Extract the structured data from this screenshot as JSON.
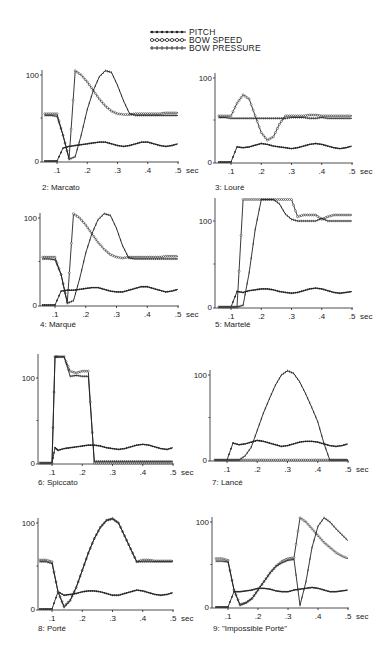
{
  "legend": {
    "items": [
      {
        "label": "PITCH",
        "marker": "filled-dot"
      },
      {
        "label": "BOW SPEED",
        "marker": "open-dot"
      },
      {
        "label": "BOW PRESSURE",
        "marker": "cross"
      }
    ]
  },
  "x_ticks": [
    ".1",
    ".2",
    ".3",
    ".4",
    ".5"
  ],
  "x_unit": "sec",
  "y_ticks": [
    "0",
    "100"
  ],
  "chart_data": [
    {
      "type": "line",
      "title": "2: Marcato",
      "xlabel": "sec",
      "ylabel": "",
      "xlim": [
        0.05,
        0.5
      ],
      "ylim": [
        0,
        100
      ],
      "x": [
        0.06,
        0.08,
        0.1,
        0.12,
        0.14,
        0.16,
        0.18,
        0.2,
        0.22,
        0.24,
        0.26,
        0.28,
        0.3,
        0.32,
        0.34,
        0.36,
        0.38,
        0.4,
        0.42,
        0.44,
        0.46,
        0.48,
        0.5
      ],
      "series": [
        {
          "name": "PITCH",
          "values": [
            0,
            0,
            0,
            15,
            17,
            18,
            19,
            20,
            21,
            22,
            22,
            20,
            18,
            17,
            18,
            20,
            22,
            22,
            20,
            18,
            17,
            18,
            20
          ]
        },
        {
          "name": "BOW SPEED",
          "values": [
            55,
            55,
            55,
            30,
            3,
            105,
            100,
            92,
            82,
            72,
            64,
            58,
            55,
            54,
            54,
            55,
            55,
            55,
            55,
            55,
            56,
            56,
            56
          ]
        },
        {
          "name": "BOW PRESSURE",
          "values": [
            53,
            53,
            52,
            30,
            2,
            5,
            30,
            60,
            82,
            98,
            105,
            103,
            88,
            70,
            55,
            53,
            53,
            53,
            53,
            53,
            53,
            53,
            53
          ]
        }
      ]
    },
    {
      "type": "line",
      "title": "3: Louré",
      "xlabel": "sec",
      "ylabel": "",
      "xlim": [
        0.05,
        0.5
      ],
      "ylim": [
        0,
        100
      ],
      "x": [
        0.06,
        0.08,
        0.1,
        0.12,
        0.14,
        0.16,
        0.18,
        0.2,
        0.22,
        0.24,
        0.26,
        0.28,
        0.3,
        0.32,
        0.34,
        0.36,
        0.38,
        0.4,
        0.42,
        0.44,
        0.46,
        0.48,
        0.5
      ],
      "series": [
        {
          "name": "PITCH",
          "values": [
            0,
            0,
            0,
            18,
            17,
            18,
            20,
            22,
            21,
            19,
            18,
            17,
            16,
            17,
            19,
            21,
            22,
            21,
            19,
            17,
            16,
            17,
            19
          ]
        },
        {
          "name": "BOW SPEED",
          "values": [
            55,
            55,
            55,
            70,
            80,
            75,
            55,
            35,
            26,
            30,
            45,
            55,
            55,
            55,
            55,
            56,
            56,
            55,
            55,
            55,
            55,
            55,
            55
          ]
        },
        {
          "name": "BOW PRESSURE",
          "values": [
            53,
            53,
            52,
            52,
            52,
            52,
            52,
            52,
            52,
            52,
            52,
            52,
            53,
            53,
            53,
            52,
            52,
            53,
            52,
            52,
            52,
            52,
            52
          ]
        }
      ]
    },
    {
      "type": "line",
      "title": "4: Marqué",
      "xlabel": "sec",
      "ylabel": "",
      "xlim": [
        0.05,
        0.5
      ],
      "ylim": [
        0,
        100
      ],
      "x": [
        0.06,
        0.08,
        0.1,
        0.12,
        0.14,
        0.16,
        0.18,
        0.2,
        0.22,
        0.24,
        0.26,
        0.28,
        0.3,
        0.32,
        0.34,
        0.36,
        0.38,
        0.4,
        0.42,
        0.44,
        0.46,
        0.48,
        0.5
      ],
      "series": [
        {
          "name": "PITCH",
          "values": [
            0,
            0,
            0,
            16,
            17,
            17,
            18,
            19,
            20,
            20,
            18,
            16,
            15,
            15,
            17,
            19,
            21,
            21,
            19,
            17,
            15,
            16,
            18
          ]
        },
        {
          "name": "BOW SPEED",
          "values": [
            55,
            55,
            55,
            35,
            3,
            105,
            100,
            92,
            82,
            72,
            64,
            58,
            55,
            54,
            55,
            55,
            55,
            55,
            55,
            55,
            56,
            56,
            56
          ]
        },
        {
          "name": "BOW PRESSURE",
          "values": [
            53,
            53,
            52,
            35,
            2,
            5,
            30,
            60,
            82,
            98,
            105,
            103,
            88,
            68,
            54,
            53,
            53,
            53,
            53,
            53,
            53,
            53,
            53
          ]
        }
      ]
    },
    {
      "type": "line",
      "title": "5: Martelé",
      "xlabel": "sec",
      "ylabel": "",
      "xlim": [
        0.05,
        0.5
      ],
      "ylim": [
        0,
        100
      ],
      "x": [
        0.06,
        0.08,
        0.1,
        0.12,
        0.14,
        0.16,
        0.18,
        0.2,
        0.22,
        0.24,
        0.26,
        0.28,
        0.3,
        0.32,
        0.34,
        0.36,
        0.38,
        0.4,
        0.42,
        0.44,
        0.46,
        0.48,
        0.5
      ],
      "series": [
        {
          "name": "PITCH",
          "values": [
            0,
            0,
            0,
            18,
            17,
            19,
            20,
            21,
            21,
            20,
            18,
            17,
            16,
            17,
            19,
            21,
            22,
            21,
            19,
            17,
            16,
            17,
            18
          ]
        },
        {
          "name": "BOW SPEED",
          "values": [
            0,
            0,
            0,
            0,
            125,
            125,
            125,
            125,
            125,
            125,
            125,
            125,
            125,
            105,
            107,
            107,
            107,
            102,
            105,
            107,
            107,
            107,
            107
          ]
        },
        {
          "name": "BOW PRESSURE",
          "values": [
            0,
            0,
            0,
            0,
            2,
            40,
            90,
            125,
            125,
            125,
            120,
            108,
            102,
            100,
            100,
            100,
            100,
            103,
            100,
            100,
            100,
            100,
            100
          ]
        }
      ]
    },
    {
      "type": "line",
      "title": "6: Spiccato",
      "xlabel": "sec",
      "ylabel": "",
      "xlim": [
        0.05,
        0.5
      ],
      "ylim": [
        0,
        100
      ],
      "x": [
        0.06,
        0.08,
        0.1,
        0.11,
        0.12,
        0.14,
        0.16,
        0.18,
        0.2,
        0.22,
        0.24,
        0.26,
        0.28,
        0.3,
        0.32,
        0.34,
        0.36,
        0.38,
        0.4,
        0.42,
        0.44,
        0.46,
        0.48,
        0.5
      ],
      "series": [
        {
          "name": "PITCH",
          "values": [
            0,
            0,
            0,
            18,
            15,
            17,
            18,
            19,
            20,
            21,
            21,
            20,
            18,
            17,
            16,
            17,
            19,
            21,
            22,
            21,
            19,
            17,
            16,
            18
          ]
        },
        {
          "name": "BOW SPEED",
          "values": [
            0,
            0,
            0,
            125,
            125,
            125,
            108,
            106,
            108,
            108,
            0,
            0,
            0,
            0,
            0,
            0,
            0,
            0,
            0,
            0,
            0,
            0,
            0,
            0
          ]
        },
        {
          "name": "BOW PRESSURE",
          "values": [
            0,
            0,
            0,
            125,
            125,
            125,
            102,
            103,
            102,
            102,
            2,
            2,
            2,
            2,
            2,
            2,
            2,
            2,
            2,
            2,
            2,
            2,
            2,
            2
          ]
        }
      ]
    },
    {
      "type": "line",
      "title": "7: Lancé",
      "xlabel": "sec",
      "ylabel": "",
      "xlim": [
        0.05,
        0.5
      ],
      "ylim": [
        0,
        100
      ],
      "x": [
        0.06,
        0.08,
        0.1,
        0.12,
        0.14,
        0.16,
        0.18,
        0.2,
        0.22,
        0.24,
        0.26,
        0.28,
        0.3,
        0.32,
        0.34,
        0.36,
        0.38,
        0.4,
        0.42,
        0.44,
        0.46,
        0.48,
        0.5
      ],
      "series": [
        {
          "name": "PITCH",
          "values": [
            0,
            0,
            0,
            20,
            18,
            19,
            21,
            23,
            22,
            20,
            18,
            16,
            17,
            19,
            21,
            22,
            22,
            21,
            19,
            17,
            16,
            17,
            19
          ]
        },
        {
          "name": "BOW SPEED",
          "values": [
            0,
            0,
            0,
            0,
            0,
            0,
            0,
            0,
            0,
            0,
            0,
            0,
            0,
            0,
            0,
            0,
            0,
            0,
            0,
            0,
            0,
            0,
            0
          ]
        },
        {
          "name": "BOW PRESSURE",
          "values": [
            0,
            0,
            0,
            0,
            0,
            5,
            15,
            35,
            55,
            72,
            88,
            100,
            105,
            102,
            92,
            78,
            62,
            45,
            20,
            0,
            0,
            0,
            0
          ]
        }
      ]
    },
    {
      "type": "line",
      "title": "8: Porté",
      "xlabel": "sec",
      "ylabel": "",
      "xlim": [
        0.05,
        0.5
      ],
      "ylim": [
        0,
        100
      ],
      "x": [
        0.06,
        0.08,
        0.1,
        0.12,
        0.14,
        0.16,
        0.18,
        0.2,
        0.22,
        0.24,
        0.26,
        0.28,
        0.3,
        0.32,
        0.34,
        0.36,
        0.38,
        0.4,
        0.42,
        0.44,
        0.46,
        0.48,
        0.5
      ],
      "series": [
        {
          "name": "PITCH",
          "values": [
            0,
            0,
            0,
            20,
            16,
            17,
            18,
            20,
            21,
            21,
            20,
            18,
            16,
            16,
            18,
            20,
            22,
            21,
            19,
            17,
            16,
            17,
            19
          ]
        },
        {
          "name": "BOW SPEED",
          "values": [
            57,
            57,
            55,
            20,
            3,
            10,
            25,
            45,
            65,
            82,
            95,
            103,
            105,
            100,
            85,
            70,
            55,
            57,
            57,
            56,
            56,
            56,
            56
          ]
        },
        {
          "name": "BOW PRESSURE",
          "values": [
            55,
            55,
            53,
            20,
            2,
            10,
            25,
            45,
            65,
            82,
            95,
            103,
            105,
            100,
            85,
            70,
            55,
            55,
            55,
            55,
            55,
            55,
            55
          ]
        }
      ]
    },
    {
      "type": "line",
      "title": "9: \"Impossible Porté\"",
      "xlabel": "sec",
      "ylabel": "",
      "xlim": [
        0.05,
        0.5
      ],
      "ylim": [
        0,
        100
      ],
      "x": [
        0.06,
        0.08,
        0.1,
        0.12,
        0.14,
        0.16,
        0.18,
        0.2,
        0.22,
        0.24,
        0.26,
        0.28,
        0.3,
        0.32,
        0.34,
        0.36,
        0.38,
        0.4,
        0.42,
        0.44,
        0.46,
        0.48,
        0.5
      ],
      "series": [
        {
          "name": "PITCH",
          "values": [
            0,
            0,
            0,
            18,
            18,
            19,
            20,
            22,
            22,
            21,
            19,
            18,
            18,
            20,
            21,
            22,
            23,
            22,
            20,
            18,
            18,
            19,
            20
          ]
        },
        {
          "name": "BOW SPEED",
          "values": [
            57,
            57,
            55,
            20,
            3,
            5,
            10,
            20,
            30,
            40,
            48,
            54,
            57,
            58,
            105,
            100,
            92,
            84,
            76,
            70,
            64,
            60,
            57
          ]
        },
        {
          "name": "BOW PRESSURE",
          "values": [
            54,
            54,
            53,
            20,
            2,
            5,
            10,
            20,
            30,
            40,
            48,
            52,
            55,
            56,
            2,
            30,
            70,
            95,
            105,
            100,
            92,
            85,
            78
          ]
        }
      ]
    }
  ]
}
